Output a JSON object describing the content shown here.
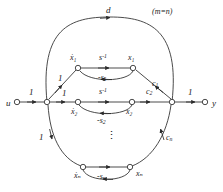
{
  "figure": {
    "kind": "signal-flow-graph",
    "note": "(m=n)",
    "stroke_color": "#2b2b2b",
    "text_color": "#1a1a1a",
    "background": "#ffffff",
    "ellipsis": "⋮"
  },
  "nodes": {
    "input": "u",
    "output": "y",
    "row1_left": "ẋ₁",
    "row1_right": "x₁",
    "row2_left": "ẋ₂",
    "row2_right": "x₂",
    "rown_left": "ẋₙ",
    "rown_right": "xₙ"
  },
  "labels": {
    "d": "d",
    "note": "(m=n)",
    "gain_u": "1",
    "gain_y": "1",
    "gain_branch_1": "1",
    "gain_branch_2": "1",
    "gain_branch_n": "1",
    "integrator_1": "s",
    "integrator_1_exp": "-1",
    "integrator_2": "s",
    "integrator_2_exp": "-1",
    "feedback_1": "-s",
    "feedback_1_sub": "1",
    "feedback_2": "-s",
    "feedback_2_sub": "2",
    "feedback_n": "-s",
    "feedback_n_sub": "n",
    "out_gain_1": "c",
    "out_gain_1_sub": "1",
    "out_gain_2": "c",
    "out_gain_2_sub": "2",
    "out_gain_n": "c",
    "out_gain_n_sub": "n"
  }
}
